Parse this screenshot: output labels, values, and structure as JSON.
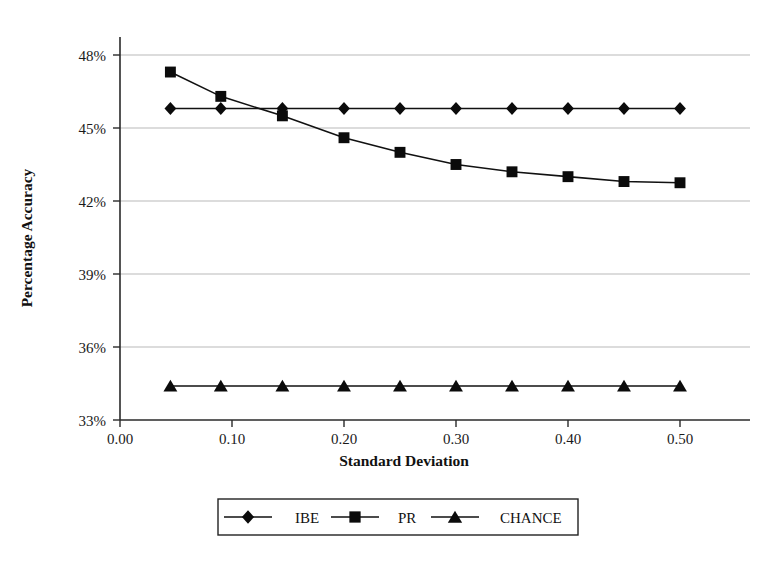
{
  "chart_data": {
    "type": "line",
    "title": "",
    "xlabel": "Standard Deviation",
    "ylabel": "Percentage Accuracy",
    "xlim": [
      0.0,
      0.53
    ],
    "ylim": [
      33,
      48.8
    ],
    "grid": true,
    "legend_position": "bottom",
    "x": [
      0.045,
      0.09,
      0.145,
      0.2,
      0.25,
      0.3,
      0.35,
      0.4,
      0.45,
      0.5
    ],
    "xticks": [
      0.0,
      0.1,
      0.2,
      0.3,
      0.4,
      0.5
    ],
    "xtick_labels": [
      "0.00",
      "0.10",
      "0.20",
      "0.30",
      "0.40",
      "0.50"
    ],
    "yticks": [
      33,
      36,
      39,
      42,
      45,
      48
    ],
    "ytick_labels": [
      "33%",
      "36%",
      "39%",
      "42%",
      "45%",
      "48%"
    ],
    "series": [
      {
        "name": "IBE",
        "marker": "diamond",
        "color": "#0b0b0b",
        "values": [
          45.8,
          45.8,
          45.8,
          45.8,
          45.8,
          45.8,
          45.8,
          45.8,
          45.8,
          45.8
        ]
      },
      {
        "name": "PR",
        "marker": "square",
        "color": "#0b0b0b",
        "values": [
          47.3,
          46.3,
          45.5,
          44.6,
          44.0,
          43.5,
          43.2,
          43.0,
          42.8,
          42.75
        ]
      },
      {
        "name": "CHANCE",
        "marker": "triangle",
        "color": "#0b0b0b",
        "values": [
          34.4,
          34.4,
          34.4,
          34.4,
          34.4,
          34.4,
          34.4,
          34.4,
          34.4,
          34.4
        ]
      }
    ]
  },
  "legend": {
    "entries": [
      {
        "label": "IBE",
        "marker": "diamond"
      },
      {
        "label": "PR",
        "marker": "square"
      },
      {
        "label": "CHANCE",
        "marker": "triangle"
      }
    ]
  },
  "colors": {
    "ink": "#111111",
    "grid": "#b9b9b9",
    "background": "#ffffff"
  }
}
